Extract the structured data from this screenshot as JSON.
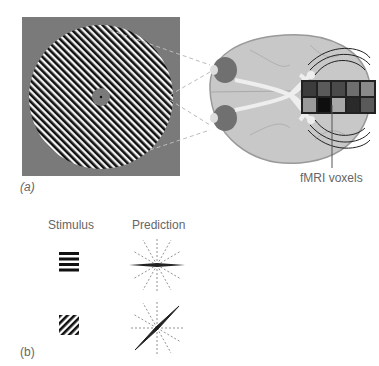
{
  "figure": {
    "panel_a": {
      "label": "(a)",
      "stimulus": {
        "description": "circular oriented grating (diagonal stripes) on gray background with central fixation disc",
        "background_color": "#7a7a7a",
        "stripe_dark": "#111111",
        "stripe_light": "#f2f2f2",
        "orientation_deg": 45
      },
      "brain": {
        "description": "ventral view of brain with eyes, optic nerves crossing at chiasm, projecting to visual cortex",
        "brain_color": "#c8c8c8",
        "eye_color": "#707070"
      },
      "voxels": {
        "label": "fMRI voxels",
        "rows": [
          [
            "#3c3c3c",
            "#5a5a5a",
            "#4a4a4a",
            "#6e6e6e",
            "#8a8a8a"
          ],
          [
            "#9a9a9a",
            "#0e0e0e",
            "#a8a8a8",
            "#2a2a2a",
            "#5a5a5a"
          ]
        ]
      }
    },
    "panel_b": {
      "label": "(b)",
      "headers": {
        "stimulus": "Stimulus",
        "prediction": "Prediction"
      },
      "rows": [
        {
          "stimulus": "horizontal-grating",
          "prediction": "horizontal-orientation-peak"
        },
        {
          "stimulus": "diagonal-grating",
          "prediction": "diagonal-orientation-peak"
        }
      ]
    }
  }
}
